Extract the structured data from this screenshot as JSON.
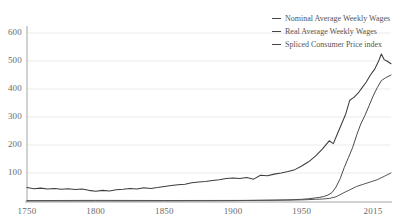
{
  "chart_data": {
    "type": "line",
    "title": "",
    "subtitle": "",
    "xlabel": "",
    "ylabel": "",
    "xlim": [
      1750,
      2015
    ],
    "ylim": [
      0,
      630
    ],
    "grid": true,
    "legend_position": "top-right",
    "yticks": [
      100,
      200,
      300,
      400,
      500,
      600
    ],
    "xticks": [
      1750,
      1800,
      1850,
      1900,
      1950,
      2015
    ],
    "series": [
      {
        "name": "Nominal Average Weekly Wages",
        "color": "#4a4a4a",
        "x": [
          1750,
          1800,
          1850,
          1900,
          1920,
          1940,
          1950,
          1955,
          1960,
          1963,
          1966,
          1969,
          1972,
          1975,
          1978,
          1981,
          1984,
          1987,
          1990,
          1993,
          1996,
          1999,
          2002,
          2005,
          2008,
          2011,
          2015
        ],
        "values": [
          0.4,
          0.5,
          0.6,
          1.2,
          2.5,
          4,
          6,
          8,
          11,
          13,
          16,
          21,
          30,
          50,
          80,
          120,
          155,
          190,
          235,
          275,
          305,
          340,
          375,
          405,
          430,
          440,
          450
        ]
      },
      {
        "name": "Real Average Weekly Wages",
        "color": "#3d3d3d",
        "x": [
          1750,
          1755,
          1760,
          1765,
          1770,
          1775,
          1780,
          1785,
          1790,
          1795,
          1800,
          1805,
          1810,
          1815,
          1820,
          1825,
          1830,
          1835,
          1840,
          1845,
          1850,
          1855,
          1860,
          1865,
          1870,
          1875,
          1880,
          1885,
          1890,
          1895,
          1900,
          1905,
          1910,
          1915,
          1920,
          1925,
          1930,
          1935,
          1940,
          1945,
          1950,
          1955,
          1960,
          1965,
          1970,
          1973,
          1976,
          1979,
          1982,
          1985,
          1988,
          1991,
          1994,
          1997,
          2000,
          2003,
          2006,
          2008,
          2010,
          2012,
          2015
        ],
        "values": [
          48,
          44,
          46,
          43,
          45,
          42,
          44,
          41,
          43,
          38,
          35,
          38,
          36,
          40,
          42,
          45,
          43,
          47,
          45,
          48,
          52,
          55,
          58,
          60,
          65,
          68,
          70,
          73,
          76,
          80,
          82,
          80,
          84,
          78,
          92,
          90,
          96,
          100,
          105,
          112,
          125,
          140,
          160,
          185,
          215,
          205,
          240,
          275,
          310,
          360,
          370,
          385,
          405,
          425,
          450,
          470,
          500,
          525,
          505,
          500,
          490
        ]
      },
      {
        "name": "Spliced Consumer Price index",
        "color": "#555555",
        "x": [
          1750,
          1800,
          1850,
          1900,
          1930,
          1950,
          1960,
          1965,
          1970,
          1975,
          1980,
          1985,
          1990,
          1995,
          2000,
          2005,
          2010,
          2015
        ],
        "values": [
          1.5,
          2.2,
          1.8,
          2.0,
          2.6,
          4,
          6,
          7,
          9,
          15,
          28,
          40,
          52,
          60,
          68,
          76,
          88,
          100
        ]
      }
    ]
  },
  "legend": {
    "items": [
      {
        "label": "Nominal Average Weekly Wages"
      },
      {
        "label": "Real Average Weekly Wages"
      },
      {
        "label": "Spliced Consumer Price index"
      }
    ]
  },
  "axes": {
    "y_tick_labels": [
      "600",
      "500",
      "400",
      "300",
      "200",
      "100"
    ],
    "x_tick_labels": [
      "1750",
      "1800",
      "1850",
      "1900",
      "1950",
      "2015"
    ]
  },
  "colors": {
    "gridline": "#e6e6e6",
    "axis": "#9a9a9a",
    "line": "#444444",
    "text": "#6b6b6b",
    "background": "#ffffff"
  }
}
